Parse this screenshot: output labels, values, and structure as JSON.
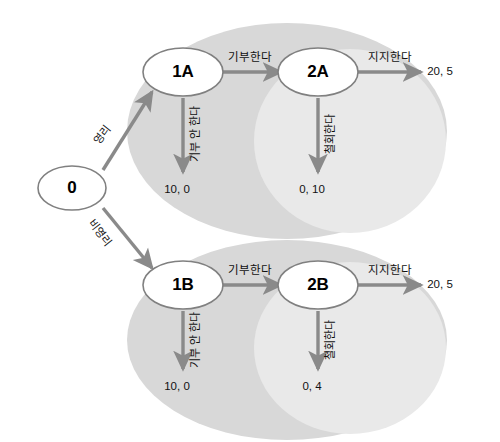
{
  "diagram": {
    "type": "extensive-form-game-tree",
    "title": "",
    "colors": {
      "info_set_outer": "#d6d6d6",
      "info_set_inner": "#e7e7e7",
      "node_fill": "#ffffff",
      "node_stroke": "#7a7a7a",
      "arrow": "#8a8a8a",
      "text": "#111111",
      "background": "#ffffff"
    },
    "nodes": [
      {
        "id": "root",
        "label": "0",
        "cx": 72,
        "cy": 188
      },
      {
        "id": "n1A",
        "label": "1A",
        "cx": 183,
        "cy": 72
      },
      {
        "id": "n2A",
        "label": "2A",
        "cx": 318,
        "cy": 72
      },
      {
        "id": "n1B",
        "label": "1B",
        "cx": 183,
        "cy": 285
      },
      {
        "id": "n2B",
        "label": "2B",
        "cx": 318,
        "cy": 285
      }
    ],
    "information_sets": [
      {
        "id": "set-a",
        "branch": "A",
        "cx": 287,
        "cy": 131,
        "rx": 160,
        "ry": 108
      },
      {
        "id": "set-b",
        "branch": "B",
        "cx": 287,
        "cy": 340,
        "rx": 160,
        "ry": 100
      },
      {
        "id": "set-a-inner",
        "branch": "A-inner",
        "cx": 348,
        "cy": 141,
        "rx": 98,
        "ry": 92
      },
      {
        "id": "set-b-inner",
        "branch": "B-inner",
        "cx": 348,
        "cy": 348,
        "rx": 98,
        "ry": 86
      }
    ],
    "edges": [
      {
        "id": "e-root-1A",
        "from": "root",
        "to": "n1A",
        "label": "영리",
        "label_x": 101,
        "label_y": 134,
        "rotate": -52
      },
      {
        "id": "e-root-1B",
        "from": "root",
        "to": "n1B",
        "label": "비영리",
        "label_x": 101,
        "label_y": 232,
        "rotate": 52
      },
      {
        "id": "e-1A-2A",
        "from": "n1A",
        "to": "n2A",
        "label": "기부한다",
        "label_x": 250,
        "label_y": 56,
        "rotate": 0
      },
      {
        "id": "e-1B-2B",
        "from": "n1B",
        "to": "n2B",
        "label": "기부한다",
        "label_x": 250,
        "label_y": 269,
        "rotate": 0
      },
      {
        "id": "e-1A-down",
        "from": "n1A",
        "to": "payoff-1A",
        "label": "기부 안 한다",
        "label_x": 194,
        "label_y": 134,
        "rotate": -90
      },
      {
        "id": "e-1B-down",
        "from": "n1B",
        "to": "payoff-1B",
        "label": "기부 안 한다",
        "label_x": 194,
        "label_y": 340,
        "rotate": -90
      },
      {
        "id": "e-2A-down",
        "from": "n2A",
        "to": "payoff-2A",
        "label": "철회한다",
        "label_x": 329,
        "label_y": 134,
        "rotate": -90
      },
      {
        "id": "e-2B-down",
        "from": "n2B",
        "to": "payoff-2B",
        "label": "철회한다",
        "label_x": 329,
        "label_y": 340,
        "rotate": -90
      },
      {
        "id": "e-2A-right",
        "from": "n2A",
        "to": "payoff-2A-right",
        "label": "지지한다",
        "label_x": 390,
        "label_y": 56,
        "rotate": 0
      },
      {
        "id": "e-2B-right",
        "from": "n2B",
        "to": "payoff-2B-right",
        "label": "지지한다",
        "label_x": 390,
        "label_y": 269,
        "rotate": 0
      }
    ],
    "payoffs": [
      {
        "id": "payoff-1A",
        "value": "10, 0",
        "x": 177,
        "y": 183
      },
      {
        "id": "payoff-2A",
        "value": "0, 10",
        "x": 312,
        "y": 183
      },
      {
        "id": "payoff-2A-right",
        "value": "20, 5",
        "x": 440,
        "y": 65
      },
      {
        "id": "payoff-1B",
        "value": "10, 0",
        "x": 177,
        "y": 380
      },
      {
        "id": "payoff-2B",
        "value": "0, 4",
        "x": 312,
        "y": 380
      },
      {
        "id": "payoff-2B-right",
        "value": "20, 5",
        "x": 440,
        "y": 278
      }
    ]
  }
}
